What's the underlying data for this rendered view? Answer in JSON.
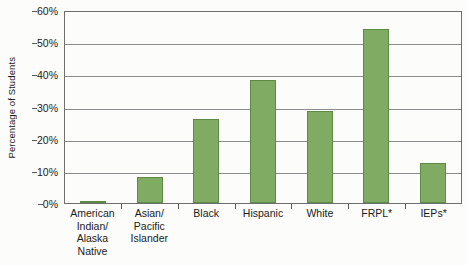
{
  "chart_data": {
    "type": "bar",
    "title": "",
    "xlabel": "",
    "ylabel": "Percentage of Students",
    "ylim": [
      0,
      60
    ],
    "ytick_labels": [
      "0%",
      "10%",
      "20%",
      "30%",
      "40%",
      "50%",
      "60%"
    ],
    "ytick_values": [
      0,
      10,
      20,
      30,
      40,
      50,
      60
    ],
    "grid": true,
    "legend": "none",
    "categories": [
      "American Indian/ Alaska Native",
      "Asian/ Pacific Islander",
      "Black",
      "Hispanic",
      "White",
      "FRPL*",
      "IEPs*"
    ],
    "category_lines": [
      [
        "American",
        "Indian/",
        "Alaska",
        "Native"
      ],
      [
        "Asian/",
        "Pacific",
        "Islander"
      ],
      [
        "Black"
      ],
      [
        "Hispanic"
      ],
      [
        "White"
      ],
      [
        "FRPL*"
      ],
      [
        "IEPs*"
      ]
    ],
    "values": [
      0.5,
      8.2,
      26.2,
      38.2,
      28.5,
      54.0,
      12.4
    ],
    "bar_color": "#7fab62",
    "bar_border_color": "#5d8b45",
    "gridline_color": "#8a8b8d",
    "axis_color": "#6e6f71",
    "background_color": "#fcfcfa"
  }
}
